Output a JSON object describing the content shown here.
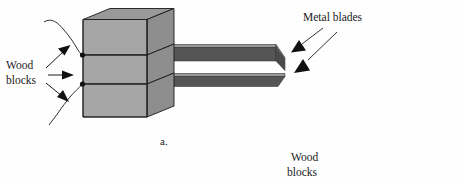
{
  "figure": {
    "caption": "a.",
    "background_color": "#ffffff",
    "colors": {
      "block_front": "#a6a6a6",
      "block_top": "#9a9a9a",
      "block_side": "#8e8e8e",
      "blade_body": "#555555",
      "blade_top_edge": "#9a9a9a",
      "blade_tip": "#4a4a4a",
      "outline": "#1a1a1a",
      "text": "#1a1a1a"
    },
    "labels": [
      {
        "id": "wood-blocks-left",
        "lines": [
          "Wood",
          "blocks"
        ],
        "line1": "Wood",
        "line2": "blocks",
        "x": 6,
        "y": 66,
        "arrow_count": 3
      },
      {
        "id": "metal-blades",
        "lines": [
          "Metal blades"
        ],
        "line1": "Metal blades",
        "x": 303,
        "y": 18,
        "arrow_count": 2
      },
      {
        "id": "wood-blocks-bottom-right",
        "lines": [
          "Wood",
          "blocks"
        ],
        "line1": "Wood",
        "line2": "blocks",
        "x": 289,
        "y": 158,
        "arrow_count": 0
      }
    ],
    "objects": {
      "wood_block_count": 3,
      "metal_blade_count": 2,
      "block_label": "Wood block",
      "blade_label": "Metal blade"
    }
  }
}
